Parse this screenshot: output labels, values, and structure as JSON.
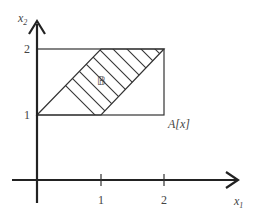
{
  "diagram": {
    "axes": {
      "x_label": "x",
      "x_sub": "1",
      "y_label": "x",
      "y_sub": "2",
      "x_ticks": [
        "1",
        "2"
      ],
      "y_ticks": [
        "1",
        "2"
      ]
    },
    "rectangle_label": "A[x]",
    "region_label": "𝔹",
    "rectangle": {
      "x1": [
        0,
        2
      ],
      "x2": [
        1,
        2
      ]
    },
    "region_vertices": [
      [
        0,
        1
      ],
      [
        1,
        2
      ],
      [
        2,
        2
      ],
      [
        1,
        1
      ]
    ],
    "colors": {
      "line": "#222222",
      "background": "#ffffff"
    }
  }
}
